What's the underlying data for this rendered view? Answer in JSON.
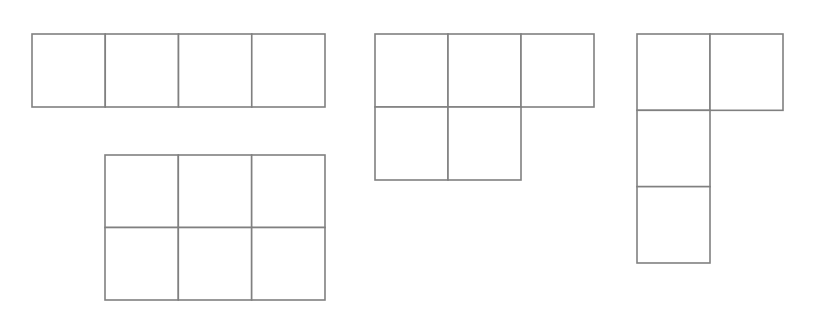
{
  "page": {
    "background_color": "#ffffff",
    "width": 834,
    "height": 315
  },
  "style": {
    "line_color": "#808080",
    "fill_color": "#ffffff",
    "line_width": 1.6
  },
  "figures": [
    {
      "id": "figure-1",
      "name": "i-tetromino-horizontal-strip",
      "label": "1 by 4 horizontal strip",
      "cell_count": 4,
      "rows": 1,
      "columns": 4,
      "origin_x": 32,
      "origin_y": 34,
      "cell_width": 73.25,
      "cell_height": 73,
      "cells": [
        {
          "row": 0,
          "col": 0
        },
        {
          "row": 0,
          "col": 1
        },
        {
          "row": 0,
          "col": 2
        },
        {
          "row": 0,
          "col": 3
        }
      ]
    },
    {
      "id": "figure-2",
      "name": "rectangle-two-by-three",
      "label": "2 by 3 rectangle",
      "cell_count": 6,
      "rows": 2,
      "columns": 3,
      "origin_x": 105,
      "origin_y": 155,
      "cell_width": 73.33,
      "cell_height": 72.5,
      "cells": [
        {
          "row": 0,
          "col": 0
        },
        {
          "row": 0,
          "col": 1
        },
        {
          "row": 0,
          "col": 2
        },
        {
          "row": 1,
          "col": 0
        },
        {
          "row": 1,
          "col": 1
        },
        {
          "row": 1,
          "col": 2
        }
      ]
    },
    {
      "id": "figure-3",
      "name": "p-pentomino",
      "label": "P pentomino: top row of three, bottom row of two",
      "cell_count": 5,
      "rows": 2,
      "columns": 3,
      "origin_x": 375,
      "origin_y": 34,
      "cell_width": 73,
      "cell_height": 73,
      "cells": [
        {
          "row": 0,
          "col": 0
        },
        {
          "row": 0,
          "col": 1
        },
        {
          "row": 0,
          "col": 2
        },
        {
          "row": 1,
          "col": 0
        },
        {
          "row": 1,
          "col": 1
        }
      ]
    },
    {
      "id": "figure-4",
      "name": "l-tetromino-vertical",
      "label": "L tetromino: vertical column of three with one cell right of top",
      "cell_count": 4,
      "rows": 3,
      "columns": 2,
      "origin_x": 637,
      "origin_y": 34,
      "cell_width": 73,
      "cell_height": 76.33,
      "cells": [
        {
          "row": 0,
          "col": 0
        },
        {
          "row": 0,
          "col": 1
        },
        {
          "row": 1,
          "col": 0
        },
        {
          "row": 2,
          "col": 0
        }
      ]
    }
  ]
}
